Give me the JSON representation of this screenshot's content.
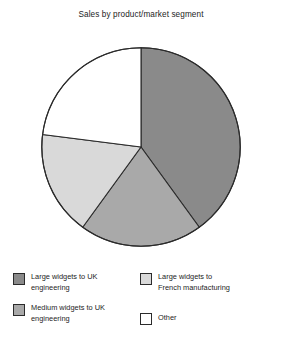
{
  "chart_data": {
    "type": "pie",
    "title": "Sales by product/market segment",
    "xlabel": "",
    "ylabel": "",
    "legend_position": "bottom",
    "grid": false,
    "start_angle_deg": 90,
    "direction": "clockwise",
    "categories": [
      "Large widgets to UK engineering",
      "Large widgets to French manufacturing",
      "Medium widgets to UK engineering",
      "Other"
    ],
    "values": [
      40,
      20,
      17,
      23
    ],
    "slices": [
      {
        "label": "Large widgets to UK engineering",
        "value": 40,
        "color": "#8a8a8a"
      },
      {
        "label": "Large widgets to French manufacturing",
        "value": 20,
        "color": "#a9a9a9"
      },
      {
        "label": "Medium widgets to UK engineering",
        "value": 17,
        "color": "#d9d9d9"
      },
      {
        "label": "Other",
        "value": 23,
        "color": "#ffffff"
      }
    ]
  },
  "title": "Sales by product/market segment",
  "legend": {
    "items": [
      {
        "label_line1": "Large widgets to UK",
        "label_line2": "engineering",
        "label": "Large widgets to UK engineering",
        "color": "#8a8a8a"
      },
      {
        "label_line1": "Large widgets to",
        "label_line2": "French manufacturing",
        "label": "Large widgets to French manufacturing",
        "color": "#d9d9d9"
      },
      {
        "label_line1": "Medium widgets to UK",
        "label_line2": "engineering",
        "label": "Medium widgets to UK engineering",
        "color": "#a9a9a9"
      },
      {
        "label_line1": "Other",
        "label_line2": "",
        "label": "Other",
        "color": "#ffffff"
      }
    ]
  },
  "colors": {
    "slice_dark": "#8a8a8a",
    "slice_medium": "#a9a9a9",
    "slice_light": "#d9d9d9",
    "slice_white": "#ffffff",
    "outline": "#2b2b2b",
    "background": "#ffffff",
    "text": "#1d1d1d"
  }
}
